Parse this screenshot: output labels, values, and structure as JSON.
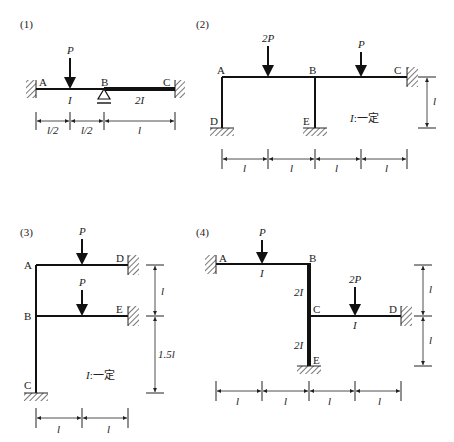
{
  "diagrams": [
    {
      "number": "(1)",
      "nodes": [
        "A",
        "B",
        "C"
      ],
      "load": "P",
      "stiffness": [
        "I",
        "2I"
      ],
      "dims": [
        "l/2",
        "l/2",
        "l"
      ]
    },
    {
      "number": "(2)",
      "nodes": [
        "A",
        "B",
        "C",
        "D",
        "E"
      ],
      "loads": [
        "2P",
        "P"
      ],
      "note_I": "I",
      "note_rest": ":一定",
      "dims_h": [
        "l",
        "l",
        "l",
        "l"
      ],
      "dim_v": "l"
    },
    {
      "number": "(3)",
      "nodes": [
        "A",
        "B",
        "C",
        "D",
        "E"
      ],
      "loads": [
        "P",
        "P"
      ],
      "note_I": "I",
      "note_rest": ":一定",
      "dims_h": [
        "l",
        "l"
      ],
      "dims_v": [
        "l",
        "1.5l"
      ]
    },
    {
      "number": "(4)",
      "nodes": [
        "A",
        "B",
        "C",
        "D",
        "E"
      ],
      "loads": [
        "P",
        "2P"
      ],
      "stiffness": [
        "I",
        "2I",
        "I",
        "2I"
      ],
      "dims_h": [
        "l",
        "l",
        "l",
        "l"
      ],
      "dims_v": [
        "l",
        "l"
      ]
    }
  ]
}
